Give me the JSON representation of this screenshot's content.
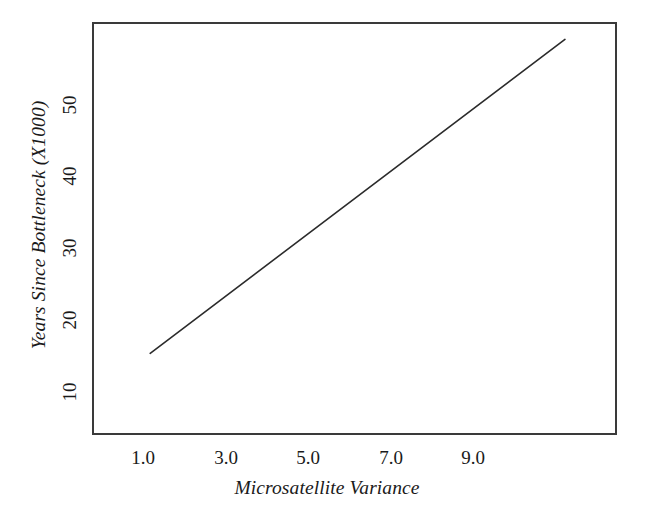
{
  "figure": {
    "background_color": "#ffffff",
    "frame_color": "#3a3a3a",
    "line_color": "#2b2b2b"
  },
  "chart_data": {
    "type": "line",
    "title": "",
    "subtitle": "",
    "xlabel": "Microsatellite Variance",
    "ylabel": "Years Since Bottleneck (X1000)",
    "xlim": [
      0.0,
      12.7
    ],
    "ylim": [
      2.0,
      60.5
    ],
    "xticks": [
      1.0,
      3.0,
      5.0,
      7.0,
      9.0
    ],
    "xticklabels": [
      "1.0",
      "3.0",
      "5.0",
      "7.0",
      "9.0"
    ],
    "yticks": [
      10,
      20,
      30,
      40,
      50
    ],
    "yticklabels": [
      "10",
      "20",
      "30",
      "40",
      "50"
    ],
    "grid": false,
    "legend": false,
    "legend_position": "none",
    "series": [
      {
        "name": "Years Since Bottleneck vs Microsatellite Variance",
        "color": "#2b2b2b",
        "linewidth": 1.6,
        "x": [
          1.37,
          11.48
        ],
        "y": [
          13.4,
          58.3
        ],
        "relationship": "linear",
        "slope": 4.44,
        "intercept": 7.32
      }
    ],
    "annotations": []
  }
}
